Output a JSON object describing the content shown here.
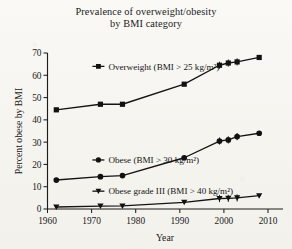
{
  "chart_data": {
    "type": "line",
    "title": "Prevalence of overweight/obesity by BMI category",
    "title_line1": "Prevalence of overweight/obesity",
    "title_line2": "by BMI category",
    "xlabel": "Year",
    "ylabel": "Percent obese by BMI",
    "xlim": [
      1960,
      2010
    ],
    "ylim": [
      0,
      70
    ],
    "xticks": [
      1960,
      1970,
      1980,
      1990,
      2000,
      2010
    ],
    "xticklabels": [
      "1960",
      "1970",
      "1980",
      "1990",
      "2000",
      "2010"
    ],
    "yticks": [
      0,
      10,
      20,
      30,
      40,
      50,
      60,
      70
    ],
    "yticklabels": [
      "0",
      "10",
      "20",
      "30",
      "40",
      "50",
      "60",
      "70"
    ],
    "grid": false,
    "legend_position": "inline-labels",
    "series": [
      {
        "name": "Overweight (BMI > 25 kg/m²)",
        "marker": "square",
        "label_x": 1972,
        "label_y": 64,
        "x": [
          1962,
          1972,
          1977,
          1991,
          1999,
          2001,
          2003,
          2008
        ],
        "y": [
          44.5,
          47.0,
          47.0,
          56.0,
          64.5,
          65.5,
          66.0,
          68.0
        ]
      },
      {
        "name": "Obese (BMI > 30 kg/m²)",
        "marker": "circle",
        "label_x": 1972,
        "label_y": 22,
        "x": [
          1962,
          1972,
          1977,
          1991,
          1999,
          2001,
          2003,
          2008
        ],
        "y": [
          13.0,
          14.5,
          15.0,
          23.0,
          30.5,
          31.0,
          32.5,
          34.0
        ]
      },
      {
        "name": "Obese grade III (BMI > 40 kg/m²)",
        "marker": "triangle-down",
        "label_x": 1972,
        "label_y": 8,
        "x": [
          1962,
          1972,
          1977,
          1991,
          1999,
          2001,
          2003,
          2008
        ],
        "y": [
          0.9,
          1.3,
          1.4,
          3.0,
          4.7,
          4.8,
          5.0,
          6.0
        ]
      }
    ]
  }
}
